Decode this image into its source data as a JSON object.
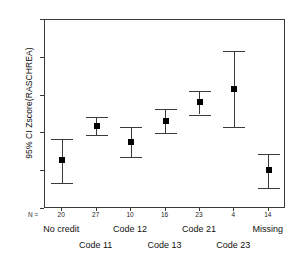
{
  "chart_data": {
    "type": "scatter",
    "title": "",
    "xlabel": "",
    "ylabel": "95% CI Zscore(RASCHREA)",
    "ylim": [
      -2,
      3
    ],
    "yticks": [
      3,
      2,
      1,
      0,
      -1,
      -2
    ],
    "ytick_labels": [
      "3",
      "2",
      "1",
      "0",
      "-1",
      "-2"
    ],
    "grid": false,
    "legend": "none",
    "error_bar_type": "95% confidence interval",
    "n_row_label": "N =",
    "categories": [
      "No credit",
      "Code 11",
      "Code 12",
      "Code 13",
      "Code 21",
      "Code 23",
      "Missing"
    ],
    "n_values": [
      20,
      27,
      10,
      16,
      23,
      4,
      14
    ],
    "values": [
      -0.7,
      0.2,
      -0.22,
      0.32,
      0.82,
      1.18,
      -0.98
    ],
    "ci_lower": [
      -1.32,
      -0.04,
      -0.62,
      0.01,
      0.5,
      0.17,
      -1.44
    ],
    "ci_upper": [
      -0.15,
      0.43,
      0.17,
      0.64,
      1.11,
      2.19,
      -0.55
    ],
    "points": [
      {
        "category": "No credit",
        "n": 20,
        "mean": -0.7,
        "ci_lower": -1.32,
        "ci_upper": -0.15
      },
      {
        "category": "Code 11",
        "n": 27,
        "mean": 0.2,
        "ci_lower": -0.04,
        "ci_upper": 0.43
      },
      {
        "category": "Code 12",
        "n": 10,
        "mean": -0.22,
        "ci_lower": -0.62,
        "ci_upper": 0.17
      },
      {
        "category": "Code 13",
        "n": 16,
        "mean": 0.32,
        "ci_lower": 0.01,
        "ci_upper": 0.64
      },
      {
        "category": "Code 21",
        "n": 23,
        "mean": 0.82,
        "ci_lower": 0.5,
        "ci_upper": 1.11
      },
      {
        "category": "Code 23",
        "n": 4,
        "mean": 1.18,
        "ci_lower": 0.17,
        "ci_upper": 2.19
      },
      {
        "category": "Missing",
        "n": 14,
        "mean": -0.98,
        "ci_lower": -1.44,
        "ci_upper": -0.55
      }
    ],
    "colors": {
      "axis": "#3a3a3a",
      "marker": "#000000",
      "whisker": "#3a3a3a",
      "background": "#ffffff"
    }
  }
}
